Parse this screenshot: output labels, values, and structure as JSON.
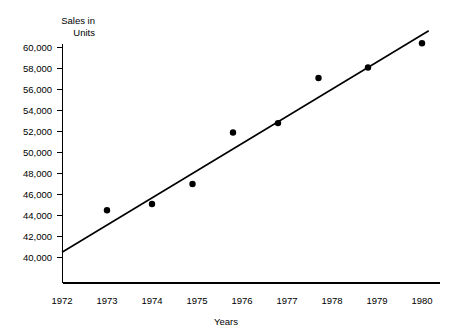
{
  "chart_data": {
    "type": "scatter",
    "title": "",
    "xlabel": "Years",
    "ylabel": "Sales in Units",
    "ylabel_line1": "Sales in",
    "ylabel_line2": "Units",
    "xlim": [
      1972,
      1980
    ],
    "ylim": [
      39000,
      61000
    ],
    "grid": false,
    "legend": "none",
    "x_ticks": [
      "1972",
      "1973",
      "1974",
      "1975",
      "1976",
      "1977",
      "1978",
      "1979",
      "1980"
    ],
    "y_ticks": [
      "40,000",
      "42,000",
      "44,000",
      "46,000",
      "48,000",
      "50,000",
      "52,000",
      "54,000",
      "56,000",
      "58,000",
      "60,000"
    ],
    "x_tick_values": [
      1972,
      1973,
      1974,
      1975,
      1976,
      1977,
      1978,
      1979,
      1980
    ],
    "y_tick_values": [
      40000,
      42000,
      44000,
      46000,
      48000,
      50000,
      52000,
      54000,
      56000,
      58000,
      60000
    ],
    "series": [
      {
        "name": "Sales",
        "marker": "filled-circle",
        "color": "#000000",
        "points": [
          {
            "x": 1973.0,
            "y": 44500
          },
          {
            "x": 1974.0,
            "y": 45100
          },
          {
            "x": 1974.9,
            "y": 47000
          },
          {
            "x": 1975.8,
            "y": 51900
          },
          {
            "x": 1976.8,
            "y": 52800
          },
          {
            "x": 1977.7,
            "y": 57100
          },
          {
            "x": 1978.8,
            "y": 58100
          },
          {
            "x": 1980.0,
            "y": 60400
          }
        ]
      }
    ],
    "trend_line": {
      "name": "Least squares trend line",
      "color": "#000000",
      "start": {
        "x": 1972.0,
        "y": 40500
      },
      "end": {
        "x": 1980.15,
        "y": 61600
      }
    }
  },
  "axes": {
    "y_axis_label_name": "sales-in-units",
    "x_axis_label_name": "years"
  }
}
